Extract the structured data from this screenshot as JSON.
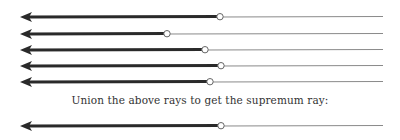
{
  "caption": "Union the above rays to get the supremum ray:",
  "colors": {
    "thick_line": "#2a2a2a",
    "thin_line": "#8a8a8a",
    "circle_fill": "#ffffff",
    "circle_stroke": "#666666",
    "text": "#333333"
  },
  "rays": [
    {
      "label": "ray-1",
      "y": 17,
      "endpoint_x": 220
    },
    {
      "label": "ray-2",
      "y": 34,
      "endpoint_x": 167
    },
    {
      "label": "ray-3",
      "y": 50,
      "endpoint_x": 205
    },
    {
      "label": "ray-4",
      "y": 66,
      "endpoint_x": 221
    },
    {
      "label": "ray-5",
      "y": 82,
      "endpoint_x": 210
    }
  ],
  "supremum_ray": {
    "label": "supremum-ray",
    "y": 126,
    "endpoint_x": 221
  },
  "ray_start_x": 20,
  "ray_end_x": 383
}
